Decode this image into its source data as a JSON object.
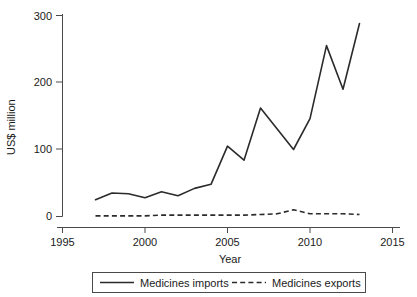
{
  "chart_data": {
    "type": "line",
    "title": "",
    "subtitle": "",
    "xlabel": "Year",
    "ylabel": "US$ million",
    "xlim": [
      1995,
      2015
    ],
    "ylim": [
      0,
      300
    ],
    "grid": false,
    "legend_position": "bottom",
    "xticks": [
      1995,
      2000,
      2005,
      2010,
      2015
    ],
    "xtick_labels": [
      "1995",
      "2000",
      "2005",
      "2010",
      "2015"
    ],
    "yticks": [
      0,
      100,
      200,
      300
    ],
    "ytick_labels": [
      "0",
      "100",
      "200",
      "300"
    ],
    "x": [
      1997,
      1998,
      1999,
      2000,
      2001,
      2002,
      2003,
      2004,
      2005,
      2006,
      2007,
      2008,
      2009,
      2010,
      2011,
      2012,
      2013
    ],
    "series": [
      {
        "name": "Medicines imports",
        "style": "solid",
        "color": "#2b2b2b",
        "values": [
          25,
          35,
          34,
          28,
          37,
          31,
          42,
          48,
          105,
          84,
          162,
          131,
          100,
          146,
          255,
          190,
          288
        ]
      },
      {
        "name": "Medicines exports",
        "style": "dashed",
        "color": "#2b2b2b",
        "values": [
          1,
          1,
          1,
          1,
          2,
          2,
          2,
          2,
          2,
          2,
          3,
          4,
          10,
          4,
          4,
          4,
          3
        ]
      }
    ]
  },
  "legend": {
    "items": [
      {
        "label": "Medicines imports",
        "style": "solid"
      },
      {
        "label": "Medicines exports",
        "style": "dashed"
      }
    ]
  }
}
